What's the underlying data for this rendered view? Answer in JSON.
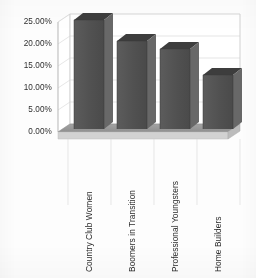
{
  "chart_data": {
    "type": "bar",
    "title": "",
    "subtitle": "",
    "xlabel": "",
    "ylabel": "",
    "categories": [
      "Country Club Women",
      "Boomers in Transition",
      "Professional Youngsters",
      "Home Builders"
    ],
    "values": [
      24.8,
      20.0,
      18.2,
      12.3
    ],
    "value_labels": [
      "24.80%",
      "20.00%",
      "18.20%",
      "12.30%"
    ],
    "ylim": [
      0,
      25
    ],
    "ytick_values": [
      0,
      5,
      10,
      15,
      20,
      25
    ],
    "ytick_labels": [
      "0.00%",
      "5.00%",
      "10.00%",
      "15.00%",
      "20.00%",
      "25.00%"
    ],
    "grid": true,
    "legend": false,
    "legend_position": "none",
    "three_d": true,
    "series": [
      {
        "name": "Share",
        "values": [
          24.8,
          20.0,
          18.2,
          12.3
        ]
      }
    ]
  },
  "style": {
    "bar_face_color": "#545454",
    "bar_top_color": "#3f3f3f",
    "bar_side_color": "#6a6a6a",
    "floor_color": "#9a9a9a",
    "floor_front_color": "#c8c8c8",
    "wall_color": "#ffffff",
    "grid_color": "#d0d0d0",
    "axis_color": "#b4b4b4",
    "text_color": "#2e2e2e",
    "background_color": "#fdfdfd"
  }
}
